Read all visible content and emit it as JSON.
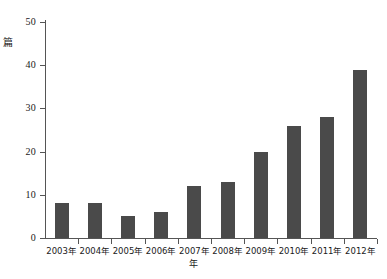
{
  "chart_data": {
    "type": "bar",
    "title": "",
    "xlabel": "年",
    "ylabel": "篇",
    "categories": [
      "2003年",
      "2004年",
      "2005年",
      "2006年",
      "2007年",
      "2008年",
      "2009年",
      "2010年",
      "2011年",
      "2012年"
    ],
    "values": [
      8,
      8,
      5,
      6,
      12,
      13,
      20,
      26,
      28,
      39
    ],
    "ylim": [
      0,
      50
    ],
    "yticks": [
      0,
      10,
      20,
      30,
      40,
      50
    ],
    "ytick_labels": [
      "0",
      "10",
      "20",
      "30",
      "40",
      "50"
    ],
    "grid": false,
    "legend": null,
    "bar_color": "#4a4a4a",
    "axis_color": "#555555"
  }
}
